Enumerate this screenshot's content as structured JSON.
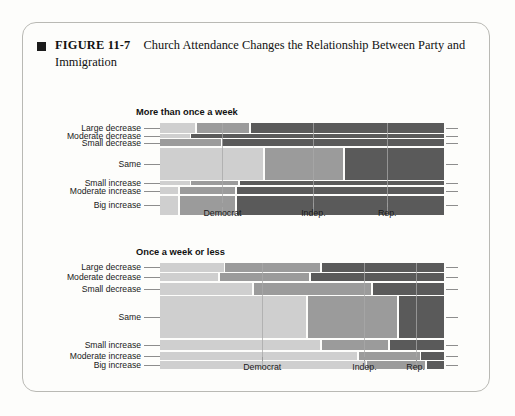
{
  "figure": {
    "marker": "filled-square",
    "label": "FIGURE 11-7",
    "caption": "Church Attendance Changes the Relationship Between Party and Immigration"
  },
  "colors": {
    "light": "#cfcfcf",
    "medium": "#9b9b9b",
    "dark": "#5a5a5a",
    "card_border": "#b9b9b4",
    "background": "#fdfdfb",
    "text": "#1a1a1a"
  },
  "legend_meaning": {
    "light": "Democrat",
    "medium": "Indep.",
    "dark": "Rep."
  },
  "chart_data": [
    {
      "type": "bar",
      "subtype": "mosaic-spine-plot",
      "title": "More than once a week",
      "xlabel": "",
      "ylabel": "",
      "orientation": "horizontal",
      "stacked": "100%",
      "grid": false,
      "legend_position": "none",
      "xlim": [
        0,
        100
      ],
      "xticks": [
        {
          "label": "Democrat",
          "value": 22
        },
        {
          "label": "Indep.",
          "value": 54
        },
        {
          "label": "Rep.",
          "value": 80
        }
      ],
      "categories": [
        "Large decrease",
        "Moderate decrease",
        "Small decrease",
        "Same",
        "Small increase",
        "Moderate increase",
        "Big increase"
      ],
      "row_heights": [
        11,
        4,
        8,
        36,
        5,
        8,
        22
      ],
      "series": [
        {
          "name": "Democrat",
          "values": [
            13,
            11,
            0,
            37,
            11,
            7,
            7
          ]
        },
        {
          "name": "Indep.",
          "values": [
            19,
            0,
            22,
            28,
            17,
            20,
            20
          ]
        },
        {
          "name": "Rep.",
          "values": [
            68,
            89,
            78,
            35,
            72,
            73,
            73
          ]
        }
      ]
    },
    {
      "type": "bar",
      "subtype": "mosaic-spine-plot",
      "title": "Once a week or less",
      "xlabel": "",
      "ylabel": "",
      "orientation": "horizontal",
      "stacked": "100%",
      "grid": false,
      "legend_position": "none",
      "xlim": [
        0,
        100
      ],
      "xticks": [
        {
          "label": "Democrat",
          "value": 36
        },
        {
          "label": "Indep.",
          "value": 72
        },
        {
          "label": "Rep.",
          "value": 90
        }
      ],
      "categories": [
        "Large decrease",
        "Moderate decrease",
        "Small decrease",
        "Same",
        "Small increase",
        "Moderate increase",
        "Big increase"
      ],
      "row_heights": [
        8,
        7,
        11,
        38,
        10,
        7,
        7
      ],
      "series": [
        {
          "name": "Democrat",
          "values": [
            23,
            21,
            33,
            52,
            57,
            70,
            73
          ]
        },
        {
          "name": "Indep.",
          "values": [
            34,
            32,
            42,
            32,
            24,
            22,
            21
          ]
        },
        {
          "name": "Rep.",
          "values": [
            43,
            47,
            25,
            16,
            19,
            8,
            6
          ]
        }
      ]
    }
  ]
}
